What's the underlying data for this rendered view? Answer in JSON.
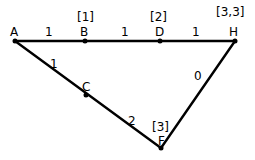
{
  "diagram": {
    "type": "weighted-graph",
    "colors": {
      "line": "#000000",
      "background": "#ffffff"
    },
    "nodes": [
      {
        "id": "A",
        "label": "A",
        "value": "",
        "x": 15,
        "y": 41
      },
      {
        "id": "B",
        "label": "B",
        "value": "[1]",
        "x": 85,
        "y": 41
      },
      {
        "id": "D",
        "label": "D",
        "value": "[2]",
        "x": 160,
        "y": 41
      },
      {
        "id": "H",
        "label": "H",
        "value": "[3,3]",
        "x": 235,
        "y": 41
      },
      {
        "id": "C",
        "label": "C",
        "value": "",
        "x": 86,
        "y": 95
      },
      {
        "id": "F",
        "label": "F",
        "value": "[3]",
        "x": 161,
        "y": 148
      }
    ],
    "edges": [
      {
        "from": "A",
        "to": "B",
        "weight": "1"
      },
      {
        "from": "B",
        "to": "D",
        "weight": "1"
      },
      {
        "from": "D",
        "to": "H",
        "weight": "1"
      },
      {
        "from": "A",
        "to": "C",
        "weight": "1"
      },
      {
        "from": "C",
        "to": "F",
        "weight": "2"
      },
      {
        "from": "F",
        "to": "H",
        "weight": "0"
      }
    ]
  }
}
